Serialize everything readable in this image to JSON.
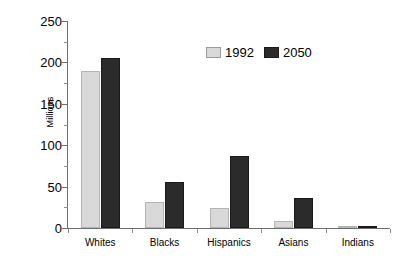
{
  "chart_data": {
    "type": "bar",
    "title": "",
    "subtitle": "",
    "xlabel": "",
    "ylabel": "Millions",
    "categories": [
      "Whites",
      "Blacks",
      "Hispanics",
      "Asians",
      "Indians"
    ],
    "series": [
      {
        "name": "1992",
        "color": "#d9d9d9",
        "values": [
          190,
          31,
          24,
          8,
          1
        ]
      },
      {
        "name": "2050",
        "color": "#2b2b2b",
        "values": [
          205,
          56,
          87,
          36,
          3
        ]
      }
    ],
    "ylim": [
      0,
      250
    ],
    "ytick_labels": [
      "0",
      "50",
      "100",
      "150",
      "200",
      "250"
    ],
    "ytick_values": [
      0,
      50,
      100,
      150,
      200,
      250
    ],
    "yminor_tick_values": [
      25,
      75,
      125,
      175,
      225
    ],
    "grid": false,
    "legend_position": "top-right-inside",
    "annotations": []
  },
  "legend": {
    "entries": [
      {
        "label": "1992",
        "swatch": "light-gray-swatch"
      },
      {
        "label": "2050",
        "swatch": "dark-swatch"
      }
    ]
  },
  "axes": {
    "y_title": "Millions"
  }
}
